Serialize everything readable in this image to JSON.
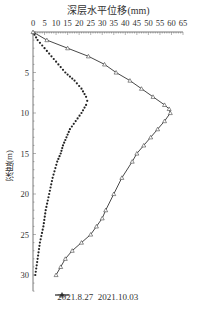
{
  "chart_data": {
    "type": "line",
    "title": "深层水平位移(mm)",
    "xlabel": "深层水平位移(mm)",
    "ylabel": "深度(m)",
    "x_axis_position": "top",
    "y_axis_inverted": true,
    "xlim": [
      0,
      65
    ],
    "ylim": [
      0,
      32
    ],
    "x_ticks": [
      "0",
      "5",
      "10",
      "15",
      "20",
      "25",
      "30",
      "35",
      "40",
      "45",
      "50",
      "55",
      "60",
      "65"
    ],
    "y_ticks": [
      "5",
      "10",
      "15",
      "20",
      "25",
      "30"
    ],
    "grid": false,
    "legend_position": "bottom",
    "series": [
      {
        "name": "2021.8.27",
        "marker": "dot",
        "points": [
          {
            "depth": 0,
            "value": 0
          },
          {
            "depth": 1,
            "value": 2
          },
          {
            "depth": 2,
            "value": 5
          },
          {
            "depth": 3,
            "value": 8
          },
          {
            "depth": 4,
            "value": 11
          },
          {
            "depth": 5,
            "value": 14
          },
          {
            "depth": 6,
            "value": 18
          },
          {
            "depth": 7,
            "value": 21
          },
          {
            "depth": 8,
            "value": 23
          },
          {
            "depth": 8.5,
            "value": 23.5
          },
          {
            "depth": 9,
            "value": 23
          },
          {
            "depth": 10,
            "value": 21
          },
          {
            "depth": 11,
            "value": 18.5
          },
          {
            "depth": 12,
            "value": 16
          },
          {
            "depth": 13,
            "value": 14.5
          },
          {
            "depth": 14,
            "value": 13
          },
          {
            "depth": 15,
            "value": 12
          },
          {
            "depth": 16,
            "value": 10.5
          },
          {
            "depth": 18,
            "value": 8.5
          },
          {
            "depth": 20,
            "value": 7
          },
          {
            "depth": 22,
            "value": 5.5
          },
          {
            "depth": 24,
            "value": 4.5
          },
          {
            "depth": 26,
            "value": 3
          },
          {
            "depth": 28,
            "value": 2
          },
          {
            "depth": 30,
            "value": 1
          }
        ]
      },
      {
        "name": "2021.10.03",
        "marker": "triangle",
        "points": [
          {
            "depth": 0,
            "value": 0
          },
          {
            "depth": 1,
            "value": 6
          },
          {
            "depth": 2,
            "value": 15
          },
          {
            "depth": 3,
            "value": 24
          },
          {
            "depth": 4,
            "value": 31
          },
          {
            "depth": 5,
            "value": 36
          },
          {
            "depth": 6,
            "value": 42
          },
          {
            "depth": 7,
            "value": 47
          },
          {
            "depth": 8,
            "value": 52
          },
          {
            "depth": 9,
            "value": 57
          },
          {
            "depth": 9.5,
            "value": 59
          },
          {
            "depth": 10,
            "value": 59.5
          },
          {
            "depth": 11,
            "value": 57
          },
          {
            "depth": 12,
            "value": 54
          },
          {
            "depth": 13,
            "value": 51
          },
          {
            "depth": 14,
            "value": 48
          },
          {
            "depth": 15,
            "value": 45
          },
          {
            "depth": 16,
            "value": 43
          },
          {
            "depth": 18,
            "value": 38.5
          },
          {
            "depth": 20,
            "value": 35
          },
          {
            "depth": 22,
            "value": 31.5
          },
          {
            "depth": 23,
            "value": 30
          },
          {
            "depth": 24,
            "value": 27.5
          },
          {
            "depth": 25,
            "value": 25
          },
          {
            "depth": 26,
            "value": 21
          },
          {
            "depth": 27,
            "value": 17
          },
          {
            "depth": 28,
            "value": 14
          },
          {
            "depth": 29,
            "value": 12
          },
          {
            "depth": 30,
            "value": 10
          }
        ]
      }
    ]
  },
  "legend": {
    "items": [
      {
        "label": "2021.8.27"
      },
      {
        "label": "2021.10.03"
      }
    ]
  }
}
